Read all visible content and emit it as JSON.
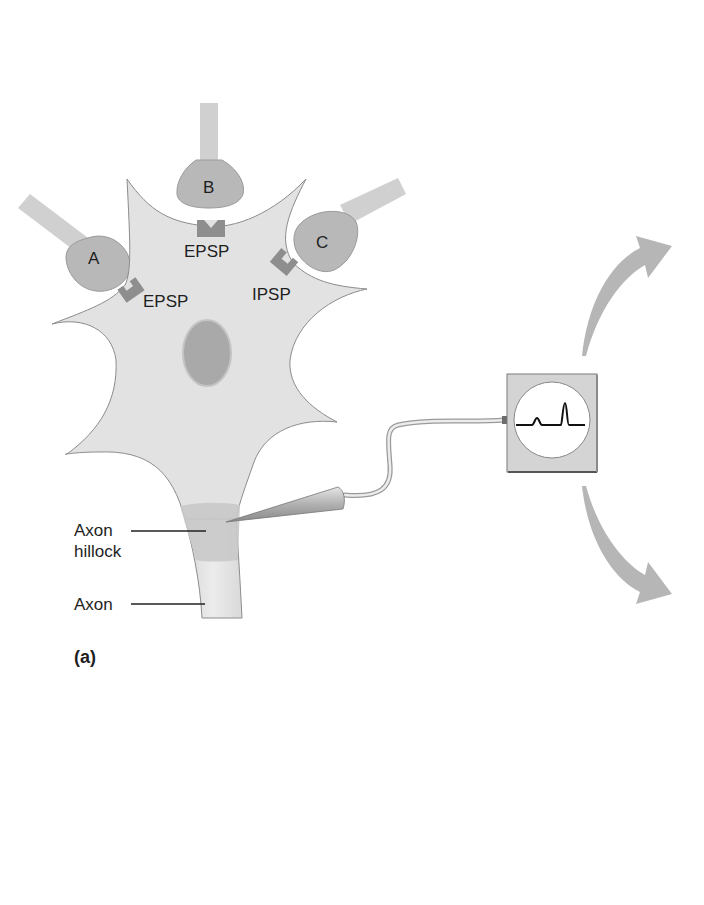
{
  "figure": {
    "panel_label": "(a)",
    "terminals": [
      {
        "id": "A",
        "label": "A"
      },
      {
        "id": "B",
        "label": "B"
      },
      {
        "id": "C",
        "label": "C"
      }
    ],
    "synapses": [
      {
        "terminal": "A",
        "label": "EPSP"
      },
      {
        "terminal": "B",
        "label": "EPSP"
      },
      {
        "terminal": "C",
        "label": "IPSP"
      }
    ],
    "callouts": {
      "axon_hillock_line1": "Axon",
      "axon_hillock_line2": "hillock",
      "axon": "Axon"
    },
    "recording": {
      "device": "oscilloscope-recorder",
      "trace": "small-bump-then-spike"
    },
    "colors": {
      "cell_body": "#e2e2e2",
      "cell_outline": "#8c8c8c",
      "terminal": "#b8b8b8",
      "receptor": "#8e8e8e",
      "nucleus": "#a9a9a9",
      "hillock": "#cccccc",
      "arrow": "#b6b6b6",
      "text": "#1e1e1e"
    }
  }
}
